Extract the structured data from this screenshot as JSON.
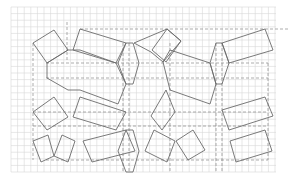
{
  "diagram": {
    "type": "tessellation-on-grid",
    "colors": {
      "background": "#ffffff",
      "grid": "#d6d6d6",
      "dashed": "#8a8a8a",
      "outline": "#6b6b6b"
    },
    "grid": {
      "x0": 11,
      "y0": 7,
      "x1": 276,
      "y1": 172,
      "step": 6.6
    },
    "dashed_lines": [
      {
        "x1": 67,
        "y1": 22,
        "x2": 67,
        "y2": 62
      },
      {
        "x1": 80,
        "y1": 29,
        "x2": 290,
        "y2": 29
      },
      {
        "x1": 33,
        "y1": 43,
        "x2": 33,
        "y2": 160
      },
      {
        "x1": 46,
        "y1": 63,
        "x2": 268,
        "y2": 63
      },
      {
        "x1": 46,
        "y1": 78,
        "x2": 268,
        "y2": 78
      },
      {
        "x1": 33,
        "y1": 112,
        "x2": 268,
        "y2": 112
      },
      {
        "x1": 33,
        "y1": 126,
        "x2": 268,
        "y2": 126
      },
      {
        "x1": 46,
        "y1": 160,
        "x2": 268,
        "y2": 160
      },
      {
        "x1": 123,
        "y1": 43,
        "x2": 123,
        "y2": 172
      },
      {
        "x1": 129,
        "y1": 43,
        "x2": 129,
        "y2": 172
      },
      {
        "x1": 170,
        "y1": 43,
        "x2": 170,
        "y2": 172
      },
      {
        "x1": 216,
        "y1": 43,
        "x2": 216,
        "y2": 172
      },
      {
        "x1": 222,
        "y1": 43,
        "x2": 222,
        "y2": 172
      },
      {
        "x1": 268,
        "y1": 63,
        "x2": 268,
        "y2": 160
      }
    ],
    "shapes": [
      {
        "kind": "square",
        "points": "33,43 54,30 68,50 47,63"
      },
      {
        "kind": "rectangle",
        "points": "80,29 126,43 116,63 73,50"
      },
      {
        "kind": "hexagon",
        "points": "126,43 133,43 139,63 133,84 126,84 118,63"
      },
      {
        "kind": "square",
        "points": "134,43 167,29 181,41 163,62 151,52"
      },
      {
        "kind": "square",
        "points": "167,29 181,41 166,62 152,50"
      },
      {
        "kind": "rectangle",
        "points": "222,43 265,29 273,50 229,63"
      },
      {
        "kind": "hexagon",
        "points": "216,43 222,43 229,63 222,84 216,84 210,63"
      },
      {
        "kind": "octagon",
        "points": "47,63 68,50 80,50 80,50 116,63 116,63 126,84 118,104 80,90 68,90 47,78"
      },
      {
        "kind": "hexagon",
        "points": "163,62 170,50 210,63 216,84 210,104 170,90"
      },
      {
        "kind": "square",
        "points": "33,112 54,97 68,117 47,130"
      },
      {
        "kind": "rectangle",
        "points": "80,97 126,112 116,130 73,117"
      },
      {
        "kind": "square",
        "points": "166,90 175,112 162,130 151,116"
      },
      {
        "kind": "rectangle",
        "points": "222,110 265,97 273,116 229,130"
      },
      {
        "kind": "square",
        "points": "33,141 48,135 54,156 41,162"
      },
      {
        "kind": "square",
        "points": "62,135 75,141 68,162 54,156"
      },
      {
        "kind": "rectangle",
        "points": "83,141 126,130 135,151 92,162"
      },
      {
        "kind": "hexagon",
        "points": "126,130 133,130 139,151 133,172 126,172 118,151"
      },
      {
        "kind": "square",
        "points": "154,130 175,141 167,162 145,151"
      },
      {
        "kind": "square",
        "points": "176,141 193,130 205,150 188,160"
      },
      {
        "kind": "rectangle",
        "points": "230,141 265,130 272,151 236,162"
      }
    ]
  }
}
